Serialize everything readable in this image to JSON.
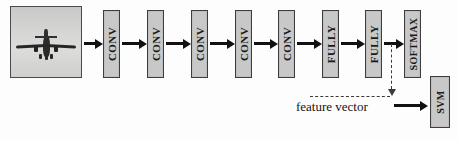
{
  "diagram": {
    "input": {
      "name": "input-image",
      "content": "airplane-photo",
      "alt": "grayscale photograph of an airplane in flight"
    },
    "layers": [
      {
        "id": "conv1",
        "label": "CONV",
        "x": 103,
        "y": 10,
        "w": 17,
        "h": 68
      },
      {
        "id": "conv2",
        "label": "CONV",
        "x": 147,
        "y": 10,
        "w": 17,
        "h": 68
      },
      {
        "id": "conv3",
        "label": "CONV",
        "x": 191,
        "y": 10,
        "w": 17,
        "h": 68
      },
      {
        "id": "conv4",
        "label": "CONV",
        "x": 235,
        "y": 10,
        "w": 17,
        "h": 68
      },
      {
        "id": "conv5",
        "label": "CONV",
        "x": 278,
        "y": 10,
        "w": 17,
        "h": 68
      },
      {
        "id": "fully1",
        "label": "FULLY",
        "x": 322,
        "y": 10,
        "w": 17,
        "h": 68
      },
      {
        "id": "fully2",
        "label": "FULLY",
        "x": 365,
        "y": 10,
        "w": 17,
        "h": 68
      },
      {
        "id": "softmax",
        "label": "SOFTMAX",
        "x": 404,
        "y": 10,
        "w": 17,
        "h": 68
      }
    ],
    "classifier": {
      "id": "svm",
      "label": "SVM",
      "x": 430,
      "y": 76,
      "w": 20,
      "h": 52
    },
    "annotations": {
      "feature_vector_label": "feature vector"
    },
    "colors": {
      "block_fill": "#c8c8c8",
      "block_border": "#3d3d3d",
      "arrow": "#111111",
      "dashed": "#3a3a3a",
      "background": "#fdfdfd",
      "text": "#141414"
    }
  }
}
